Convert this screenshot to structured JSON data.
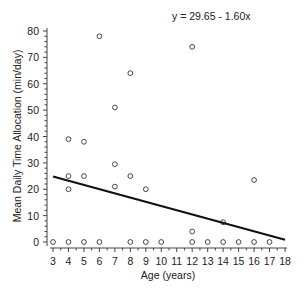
{
  "chart_data": {
    "type": "scatter",
    "title": "",
    "annotation": "y = 29.65 - 1.60x",
    "xlabel": "Age (years)",
    "ylabel": "Mean Daily Time Allocation (min/day)",
    "xlim": [
      3,
      18
    ],
    "ylim": [
      0,
      80
    ],
    "xticks": [
      3,
      4,
      5,
      6,
      7,
      8,
      9,
      10,
      11,
      12,
      13,
      14,
      15,
      16,
      17,
      18
    ],
    "yticks": [
      0,
      10,
      20,
      30,
      40,
      50,
      60,
      70,
      80
    ],
    "grid": false,
    "legend": null,
    "series": [
      {
        "name": "observations",
        "marker": "open-circle",
        "points": [
          [
            3,
            0
          ],
          [
            4,
            0
          ],
          [
            5,
            0
          ],
          [
            6,
            0
          ],
          [
            8,
            0
          ],
          [
            9,
            0
          ],
          [
            10,
            0
          ],
          [
            12,
            0
          ],
          [
            13,
            0
          ],
          [
            14,
            0
          ],
          [
            15,
            0
          ],
          [
            16,
            0
          ],
          [
            17,
            0
          ],
          [
            4,
            39
          ],
          [
            4,
            25
          ],
          [
            4,
            20
          ],
          [
            5,
            38
          ],
          [
            5,
            25
          ],
          [
            6,
            78
          ],
          [
            7,
            51
          ],
          [
            7,
            29.5
          ],
          [
            7,
            21
          ],
          [
            8,
            64
          ],
          [
            8,
            25
          ],
          [
            9,
            20
          ],
          [
            12,
            74
          ],
          [
            12,
            4
          ],
          [
            14,
            7.5
          ],
          [
            16,
            23.5
          ]
        ]
      },
      {
        "name": "regression",
        "type": "line",
        "intercept": 29.65,
        "slope": -1.6,
        "x_range": [
          3,
          18
        ]
      }
    ]
  }
}
